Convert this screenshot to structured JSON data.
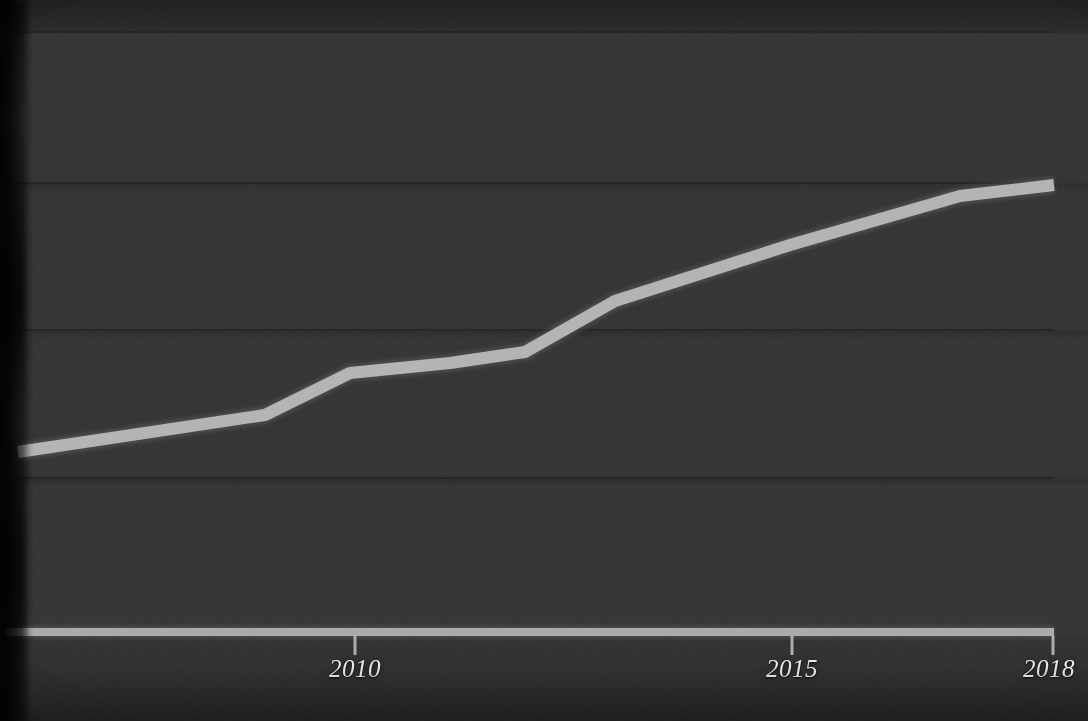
{
  "chart_data": {
    "type": "line",
    "title": "",
    "subtitle": "",
    "xlabel": "",
    "ylabel": "",
    "legend": [],
    "grid": "horizontal-only",
    "legend_position": "none",
    "xlim": [
      2006,
      2018
    ],
    "ylim": [
      0,
      4
    ],
    "x_tick_labels": [
      "2010",
      "2015",
      "2018"
    ],
    "x_ticks": [
      2010,
      2015,
      2018
    ],
    "y_tick_labels": [],
    "gridline_count": 4,
    "series": [
      {
        "name": "series-1",
        "color": "#b9b9b9",
        "x": [
          2006.1,
          2008.9,
          2009.9,
          2011.1,
          2011.9,
          2013.0,
          2015.0,
          2016.9,
          2018.0
        ],
        "values": [
          1.22,
          1.47,
          1.75,
          1.82,
          1.89,
          2.24,
          2.61,
          2.94,
          3.02
        ]
      }
    ],
    "points_pixel": [
      [
        18,
        452
      ],
      [
        265,
        415
      ],
      [
        350,
        373
      ],
      [
        450,
        363
      ],
      [
        525,
        352
      ],
      [
        615,
        301
      ],
      [
        790,
        245
      ],
      [
        960,
        196
      ],
      [
        1054,
        185
      ]
    ],
    "gridlines_pixel_y": [
      32,
      183,
      330,
      478
    ],
    "axis_pixel_y": 632,
    "plot_left_pixel": 18,
    "plot_right_pixel": 1054
  },
  "axis": {
    "ticks": [
      {
        "label": "2010",
        "x": 355,
        "align": "center"
      },
      {
        "label": "2015",
        "x": 792,
        "align": "center"
      },
      {
        "label": "2018",
        "x": 1053,
        "align": "right"
      }
    ]
  },
  "style": {
    "background_color": "#343434",
    "line_color": "#b9b9b9",
    "axis_color": "#b4b4b4",
    "gridline_color": "#262626",
    "label_color": "#e9e9e9"
  }
}
